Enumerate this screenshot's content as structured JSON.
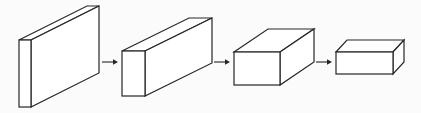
{
  "diagram": {
    "type": "flow-of-3d-blocks",
    "background_color": "#fbfbfb",
    "line_color": "#262626",
    "blocks": [
      {
        "id": "block-1",
        "front": {
          "x": 19,
          "y": 40,
          "w": 12,
          "h": 67
        },
        "depth": {
          "dx": 68,
          "dy": -34
        }
      },
      {
        "id": "block-2",
        "front": {
          "x": 122,
          "y": 51,
          "w": 23,
          "h": 45
        },
        "depth": {
          "dx": 67,
          "dy": -33
        }
      },
      {
        "id": "block-3",
        "front": {
          "x": 234,
          "y": 52,
          "w": 46,
          "h": 33
        },
        "depth": {
          "dx": 34,
          "dy": -23
        }
      },
      {
        "id": "block-4",
        "front": {
          "x": 336,
          "y": 52,
          "w": 57,
          "h": 22
        },
        "depth": {
          "dx": 11,
          "dy": -12
        }
      }
    ],
    "arrows": [
      {
        "id": "arrow-1",
        "x1": 102,
        "x2": 118,
        "y": 62
      },
      {
        "id": "arrow-2",
        "x1": 214,
        "x2": 230,
        "y": 62
      },
      {
        "id": "arrow-3",
        "x1": 316,
        "x2": 332,
        "y": 62
      }
    ]
  }
}
